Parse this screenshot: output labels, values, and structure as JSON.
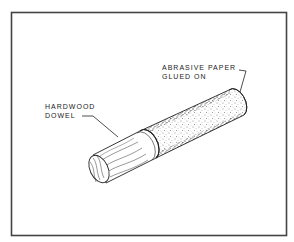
{
  "figure": {
    "labels": {
      "abrasive_line1": "ABRASIVE PAPER",
      "abrasive_line2": "GLUED ON",
      "dowel_line1": "HARDWOOD",
      "dowel_line2": "DOWEL"
    },
    "colors": {
      "ink": "#222222",
      "frame": "#444444",
      "background": "#ffffff"
    }
  }
}
